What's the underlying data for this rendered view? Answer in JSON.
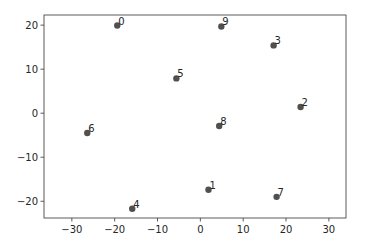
{
  "chart_data": {
    "type": "scatter",
    "title": "",
    "xlabel": "",
    "ylabel": "",
    "xlim": [
      -36.5,
      34
    ],
    "ylim": [
      -23.8,
      22.3
    ],
    "xticks": [
      -30,
      -20,
      -10,
      0,
      10,
      20,
      30
    ],
    "yticks": [
      -20,
      -10,
      0,
      10,
      20
    ],
    "grid": false,
    "legend": null,
    "marker_color": "#505050",
    "points": [
      {
        "label": "0",
        "x": -19.4,
        "y": 19.9
      },
      {
        "label": "1",
        "x": 1.9,
        "y": -17.4
      },
      {
        "label": "2",
        "x": 23.4,
        "y": 1.4
      },
      {
        "label": "3",
        "x": 17.1,
        "y": 15.4
      },
      {
        "label": "4",
        "x": -15.9,
        "y": -21.7
      },
      {
        "label": "5",
        "x": -5.6,
        "y": 7.9
      },
      {
        "label": "6",
        "x": -26.4,
        "y": -4.5
      },
      {
        "label": "7",
        "x": 17.8,
        "y": -19.0
      },
      {
        "label": "8",
        "x": 4.4,
        "y": -2.9
      },
      {
        "label": "9",
        "x": 4.9,
        "y": 19.7
      }
    ]
  }
}
